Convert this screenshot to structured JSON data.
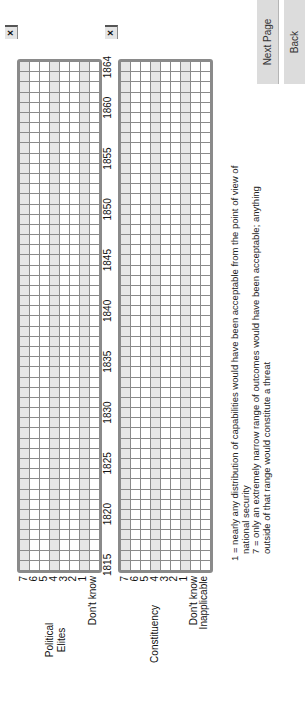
{
  "nav": {
    "next_label": "Next Page",
    "back_label": "Back"
  },
  "clear_button_label": "×",
  "years": {
    "start": 1815,
    "end": 1864,
    "tick_labels": [
      "1815",
      "1820",
      "1825",
      "1830",
      "1835",
      "1840",
      "1845",
      "1850",
      "1855",
      "1860",
      "1864"
    ]
  },
  "groups": [
    {
      "label_line1": "Political",
      "label_line2": "Elites",
      "rows": [
        "7",
        "6",
        "5",
        "4",
        "3",
        "2",
        "1",
        "Don't know"
      ]
    },
    {
      "label_line1": "Constituency",
      "label_line2": "",
      "rows": [
        "7",
        "6",
        "5",
        "4",
        "3",
        "2",
        "1",
        "Don't know",
        "Inapplicable"
      ]
    }
  ],
  "legend": {
    "line1": "1 = nearly any distribution of capabilities would have been acceptable from the point of view of",
    "line2": "national security",
    "line3": "7 = only an extremely narrow range of outcomes would have been acceptable; anything",
    "line4": "outside of that range would constitute a threat"
  },
  "colors": {
    "grid_border": "#8a8a8a",
    "cell_shade": "#e6e6e6",
    "button_bg": "#dcdcdc"
  }
}
